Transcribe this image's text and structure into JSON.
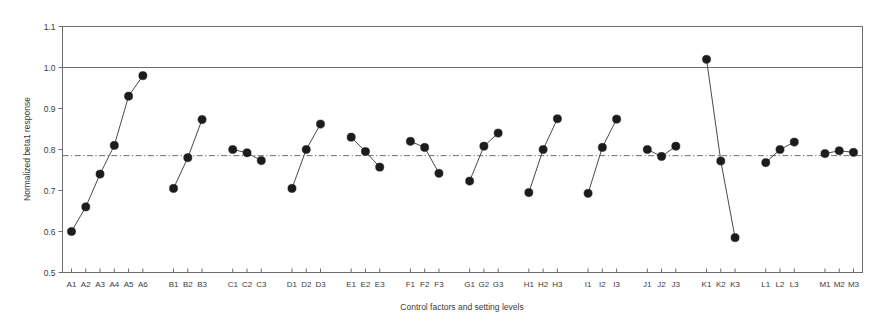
{
  "chart_data": {
    "type": "line",
    "title": "",
    "xlabel": "Control factors and setting levels",
    "ylabel": "Normalized beta1 response",
    "ylim": [
      0.5,
      1.1
    ],
    "ytick_labels": [
      "0.5",
      "0.6",
      "0.7",
      "0.8",
      "0.9",
      "1.0",
      "1.1"
    ],
    "ytick_values": [
      0.5,
      0.6,
      0.7,
      0.8,
      0.9,
      1.0,
      1.1
    ],
    "grid": false,
    "legend": "none",
    "reference_lines": [
      {
        "name": "target-line",
        "value": 1.0,
        "style": "solid"
      },
      {
        "name": "mean-line",
        "value": 0.785,
        "style": "dash-dot"
      }
    ],
    "categories": [
      "A1",
      "A2",
      "A3",
      "A4",
      "A5",
      "A6",
      "B1",
      "B2",
      "B3",
      "C1",
      "C2",
      "C3",
      "D1",
      "D2",
      "D3",
      "E1",
      "E2",
      "E3",
      "F1",
      "F2",
      "F3",
      "G1",
      "G2",
      "G3",
      "H1",
      "H2",
      "H3",
      "I1",
      "I2",
      "I3",
      "J1",
      "J2",
      "J3",
      "K1",
      "K2",
      "K3",
      "L1",
      "L2",
      "L3",
      "M1",
      "M2",
      "M3"
    ],
    "values": [
      0.6,
      0.66,
      0.74,
      0.81,
      0.93,
      0.98,
      0.705,
      0.78,
      0.873,
      0.8,
      0.792,
      0.773,
      0.705,
      0.8,
      0.862,
      0.83,
      0.795,
      0.757,
      0.82,
      0.805,
      0.742,
      0.723,
      0.808,
      0.84,
      0.695,
      0.8,
      0.875,
      0.693,
      0.805,
      0.874,
      0.8,
      0.783,
      0.808,
      1.02,
      0.772,
      0.585,
      0.768,
      0.8,
      0.818,
      0.79,
      0.797,
      0.793
    ],
    "groups": [
      {
        "name": "A",
        "start": 0,
        "count": 6
      },
      {
        "name": "B",
        "start": 6,
        "count": 3
      },
      {
        "name": "C",
        "start": 9,
        "count": 3
      },
      {
        "name": "D",
        "start": 12,
        "count": 3
      },
      {
        "name": "E",
        "start": 15,
        "count": 3
      },
      {
        "name": "F",
        "start": 18,
        "count": 3
      },
      {
        "name": "G",
        "start": 21,
        "count": 3
      },
      {
        "name": "H",
        "start": 24,
        "count": 3
      },
      {
        "name": "I",
        "start": 27,
        "count": 3
      },
      {
        "name": "J",
        "start": 30,
        "count": 3
      },
      {
        "name": "K",
        "start": 33,
        "count": 3
      },
      {
        "name": "L",
        "start": 36,
        "count": 3
      },
      {
        "name": "M",
        "start": 39,
        "count": 3
      }
    ]
  },
  "colors": {
    "marker": "#1c1c1c",
    "line": "#4a4a4a",
    "frame": "#6d6d6d",
    "text": "#3a3a3a",
    "background": "#ffffff"
  }
}
